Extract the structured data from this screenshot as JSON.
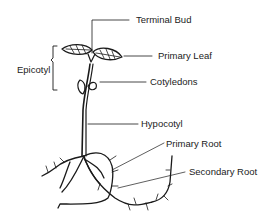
{
  "diagram": {
    "labels": {
      "terminal_bud": "Terminal Bud",
      "primary_leaf": "Primary Leaf",
      "epicotyl": "Epicotyl",
      "cotyledons": "Cotyledons",
      "hypocotyl": "Hypocotyl",
      "primary_root": "Primary Root",
      "secondary_root": "Secondary Root"
    },
    "colors": {
      "ink": "#1a1a1a",
      "background": "#ffffff"
    }
  }
}
